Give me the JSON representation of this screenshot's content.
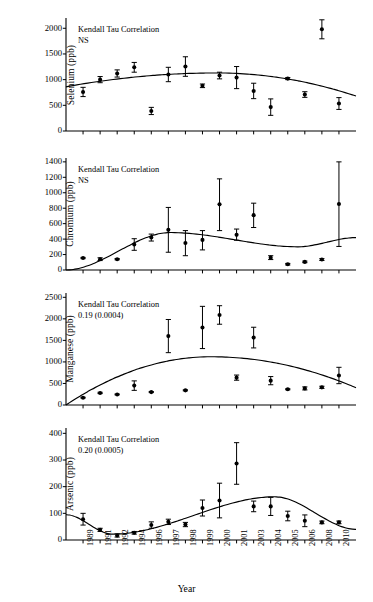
{
  "figure": {
    "background": "#ffffff",
    "ink_color": "#000000",
    "xlabel": "Year",
    "x_categories": [
      "1989",
      "1991",
      "1992",
      "1994",
      "1996",
      "1997",
      "1998",
      "1999",
      "2000",
      "2001",
      "2003",
      "2004",
      "2005",
      "2006",
      "2008",
      "2010"
    ]
  },
  "chart_data": [
    {
      "type": "scatter",
      "panel_index": 0,
      "title": "",
      "ylabel": "Selenium (ppb)",
      "xlabel": "",
      "ylim": [
        0,
        2200
      ],
      "yticks": [
        0,
        500,
        1000,
        1500,
        2000
      ],
      "ytick_labels": [
        "0",
        "500",
        "1000",
        "1500",
        "2000"
      ],
      "grid": false,
      "legend": "none",
      "annotation": [
        "Kendall Tau Correlation",
        "NS"
      ],
      "kendall_tau": "NS",
      "x": [
        "1989",
        "1991",
        "1992",
        "1994",
        "1996",
        "1997",
        "1998",
        "1999",
        "2000",
        "2001",
        "2003",
        "2004",
        "2005",
        "2006",
        "2008",
        "2010"
      ],
      "values": [
        760,
        1000,
        1120,
        1240,
        390,
        1100,
        1255,
        880,
        1080,
        1040,
        780,
        465,
        1020,
        710,
        1980,
        535
      ],
      "err_low": [
        90,
        60,
        70,
        95,
        70,
        140,
        190,
        35,
        65,
        215,
        150,
        160,
        20,
        55,
        185,
        115
      ],
      "err_high": [
        90,
        60,
        70,
        95,
        70,
        140,
        190,
        35,
        65,
        215,
        150,
        160,
        20,
        55,
        185,
        115
      ],
      "point_order_note": "values are plotted at x tick positions 1..16 in listed order except the 1980 outlier which sits at 2000",
      "fit_curve": {
        "shape": "quadratic-concave",
        "y_at_left": 860,
        "y_peak": 1130,
        "peak_x_frac": 0.52,
        "y_at_right": 680
      }
    },
    {
      "type": "scatter",
      "panel_index": 1,
      "title": "",
      "ylabel": "Chromium (ppb)",
      "xlabel": "",
      "ylim": [
        0,
        1450
      ],
      "yticks": [
        0,
        200,
        400,
        600,
        800,
        1000,
        1200,
        1400
      ],
      "ytick_labels": [
        "0",
        "200",
        "400",
        "600",
        "800",
        "1000",
        "1200",
        "1400"
      ],
      "grid": false,
      "legend": "none",
      "annotation": [
        "Kendall Tau Correlation",
        "NS"
      ],
      "kendall_tau": "NS",
      "x": [
        "1989",
        "1991",
        "1992",
        "1994",
        "1996",
        "1997",
        "1998",
        "1999",
        "2000",
        "2001",
        "2003",
        "2004",
        "2005",
        "2006",
        "2008",
        "2010"
      ],
      "values": [
        155,
        140,
        140,
        330,
        420,
        520,
        350,
        390,
        850,
        455,
        710,
        160,
        75,
        105,
        135,
        855
      ],
      "err_low": [
        8,
        18,
        8,
        75,
        45,
        290,
        165,
        130,
        340,
        70,
        160,
        25,
        10,
        10,
        12,
        550
      ],
      "err_high": [
        8,
        18,
        8,
        75,
        45,
        290,
        160,
        120,
        330,
        75,
        155,
        25,
        10,
        10,
        12,
        545
      ],
      "fit_curve": {
        "shape": "wave",
        "y_at_left": 0,
        "y_peak": 485,
        "peak_x_frac": 0.36,
        "y_trough": 300,
        "trough_x_frac": 0.8,
        "y_at_right": 420
      }
    },
    {
      "type": "scatter",
      "panel_index": 2,
      "title": "",
      "ylabel": "Manganese (ppb)",
      "xlabel": "",
      "ylim": [
        0,
        2600
      ],
      "yticks": [
        0,
        500,
        1000,
        1500,
        2000,
        2500
      ],
      "ytick_labels": [
        "0",
        "500",
        "1000",
        "1500",
        "2000",
        "2500"
      ],
      "grid": false,
      "legend": "none",
      "annotation": [
        "Kendall Tau Correlation",
        "0.19 (0.0004)"
      ],
      "kendall_tau": "0.19",
      "kendall_p": "0.0004",
      "x": [
        "1989",
        "1991",
        "1992",
        "1994",
        "1996",
        "1997",
        "1998",
        "1999",
        "2000",
        "2001",
        "2003",
        "2004",
        "2005",
        "2006",
        "2008",
        "2010"
      ],
      "values": [
        170,
        280,
        245,
        450,
        300,
        1600,
        340,
        1800,
        2090,
        635,
        1565,
        565,
        365,
        385,
        410,
        685
      ],
      "err_low": [
        10,
        15,
        10,
        110,
        12,
        385,
        12,
        490,
        215,
        60,
        240,
        95,
        12,
        35,
        25,
        190
      ],
      "err_high": [
        10,
        15,
        10,
        110,
        12,
        385,
        12,
        490,
        215,
        60,
        240,
        95,
        12,
        35,
        25,
        190
      ],
      "fit_curve": {
        "shape": "quadratic-concave",
        "y_at_left": 0,
        "y_peak": 1120,
        "peak_x_frac": 0.5,
        "y_at_right": 400
      }
    },
    {
      "type": "scatter",
      "panel_index": 3,
      "title": "",
      "ylabel": "Arsenic (ppb)",
      "xlabel": "Year",
      "ylim": [
        0,
        420
      ],
      "yticks": [
        0,
        100,
        200,
        300,
        400
      ],
      "ytick_labels": [
        "0",
        "100",
        "200",
        "300",
        "400"
      ],
      "grid": false,
      "legend": "none",
      "annotation": [
        "Kendall Tau Correlation",
        "0.20 (0.0005)"
      ],
      "kendall_tau": "0.20",
      "kendall_p": "0.0005",
      "x": [
        "1989",
        "1991",
        "1992",
        "1994",
        "1996",
        "1997",
        "1998",
        "1999",
        "2000",
        "2001",
        "2003",
        "2004",
        "2005",
        "2006",
        "2008",
        "2010"
      ],
      "values": [
        78,
        38,
        17,
        27,
        56,
        68,
        58,
        120,
        148,
        287,
        126,
        126,
        90,
        72,
        66,
        66
      ],
      "err_low": [
        22,
        6,
        6,
        5,
        12,
        10,
        8,
        30,
        65,
        78,
        20,
        34,
        18,
        22,
        5,
        5
      ],
      "err_high": [
        22,
        6,
        6,
        5,
        12,
        10,
        8,
        30,
        65,
        78,
        20,
        34,
        18,
        22,
        5,
        5
      ],
      "fit_curve": {
        "shape": "sigmoid-hump",
        "y_at_left": 95,
        "y_trough": 22,
        "trough_x_frac": 0.16,
        "y_peak": 162,
        "peak_x_frac": 0.72,
        "y_at_right": 40
      }
    }
  ]
}
